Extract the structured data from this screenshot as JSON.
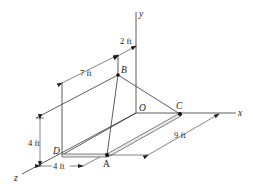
{
  "figure": {
    "type": "3D statics diagram",
    "axes": {
      "x_label": "x",
      "y_label": "y",
      "z_label": "z",
      "origin_label": "O"
    },
    "points": {
      "A": "A",
      "B": "B",
      "C": "C",
      "D": "D"
    },
    "dimensions": {
      "top_offset": "2 ft",
      "top_span": "7 ft",
      "height": "4 ft",
      "bottom_span": "4 ft",
      "diagonal_length": "9 ft"
    },
    "colors": {
      "line": "#333333",
      "background": "#ffffff",
      "plate": "#e8e8e8"
    }
  }
}
